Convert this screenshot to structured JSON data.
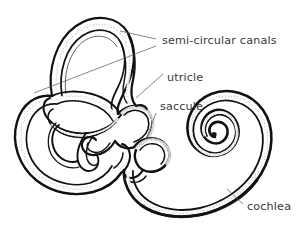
{
  "figure": {
    "kind": "anatomical-line-drawing",
    "background_color": "#ffffff",
    "ink_color": "#111111",
    "label_color": "#3a3a3a",
    "leader_color": "#555555",
    "width": 302,
    "height": 230
  },
  "labels": [
    {
      "id": "semi-circular-canals",
      "text": "semi-circular canals",
      "x": 162,
      "y": 44,
      "anchor": "start"
    },
    {
      "id": "utricle",
      "text": "utricle",
      "x": 167,
      "y": 81,
      "anchor": "start"
    },
    {
      "id": "saccule",
      "text": "saccule",
      "x": 160,
      "y": 110,
      "anchor": "start"
    },
    {
      "id": "cochlea",
      "text": "cochlea",
      "x": 247,
      "y": 210,
      "anchor": "start"
    }
  ],
  "leader_lines": [
    {
      "id": "leader-canals-upper",
      "points": "156,39 120,31"
    },
    {
      "id": "leader-canals-lower",
      "points": "156,46 34,93"
    },
    {
      "id": "leader-utricle",
      "points": "163,74 136,98"
    },
    {
      "id": "leader-saccule",
      "points": "156,113 146,139"
    },
    {
      "id": "leader-cochlea",
      "points": "243,204 227,189"
    }
  ],
  "structures": [
    {
      "id": "superior-semicircular-canal",
      "description": "large vertical loop at top"
    },
    {
      "id": "posterior-semicircular-canal",
      "description": "large loop at left"
    },
    {
      "id": "lateral-semicircular-canal",
      "description": "inner loop at left center"
    },
    {
      "id": "vestibule",
      "description": "central chamber containing utricle and saccule"
    },
    {
      "id": "utricle-sac",
      "description": "upper sac of the vestibule"
    },
    {
      "id": "saccule-sac",
      "description": "lower rounded sac near the cochlear duct"
    },
    {
      "id": "cochlea-spiral",
      "description": "spiral of about two and a half turns at right"
    }
  ]
}
